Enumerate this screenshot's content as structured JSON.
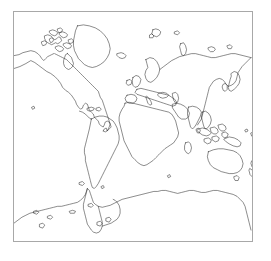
{
  "figure": {
    "type": "world-map-outline",
    "title": "",
    "projection": "mercator-like cylindrical",
    "background_color": "#ffffff",
    "frame": {
      "visible": true,
      "color": "#a8a8a8",
      "line_width": 1,
      "x": 13,
      "y": 11,
      "width": 240,
      "height": 231
    },
    "coastline": {
      "color": "#1a1a1a",
      "line_width": 0.5,
      "fill": "none"
    },
    "axis_labels": [],
    "tick_labels": [],
    "legend_entries": [],
    "annotations": []
  },
  "chart_data": {
    "type": "map",
    "title": "",
    "xlabel": "",
    "ylabel": "",
    "grid": false,
    "legend": "none",
    "xlim": [
      -180,
      180
    ],
    "ylim": [
      -90,
      84
    ],
    "landmasses": [
      "North America",
      "Greenland",
      "Canadian Arctic Archipelago",
      "South America",
      "Africa",
      "Europe",
      "British Isles",
      "Scandinavia",
      "Iceland",
      "Svalbard",
      "Novaya Zemlya",
      "Asia",
      "Japan",
      "Madagascar",
      "Indonesia",
      "New Guinea",
      "Australia",
      "New Zealand",
      "Antarctica"
    ]
  }
}
